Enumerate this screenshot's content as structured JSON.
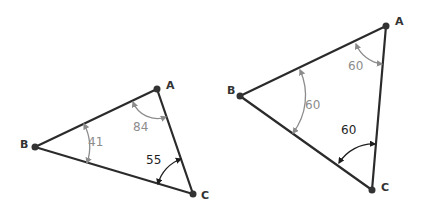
{
  "diagrams": [
    {
      "name": "scalene-triangle",
      "vertices": {
        "A": {
          "label": "A",
          "x": 157,
          "y": 89
        },
        "B": {
          "label": "B",
          "x": 35,
          "y": 147
        },
        "C": {
          "label": "C",
          "x": 193,
          "y": 194
        }
      },
      "angles": {
        "A": {
          "value": "84",
          "color": "#8c8c8c"
        },
        "B": {
          "value": "41",
          "color": "#8c8c8c"
        },
        "C": {
          "value": "55",
          "color": "#1e1e1e"
        }
      }
    },
    {
      "name": "equilateral-triangle",
      "vertices": {
        "A": {
          "label": "A",
          "x": 386,
          "y": 26
        },
        "B": {
          "label": "B",
          "x": 240,
          "y": 96
        },
        "C": {
          "label": "C",
          "x": 372,
          "y": 190
        }
      },
      "angles": {
        "A": {
          "value": "60",
          "color": "#8c8c8c"
        },
        "B": {
          "value": "60",
          "color": "#8c8c8c"
        },
        "C": {
          "value": "60",
          "color": "#1e1e1e"
        }
      }
    }
  ]
}
